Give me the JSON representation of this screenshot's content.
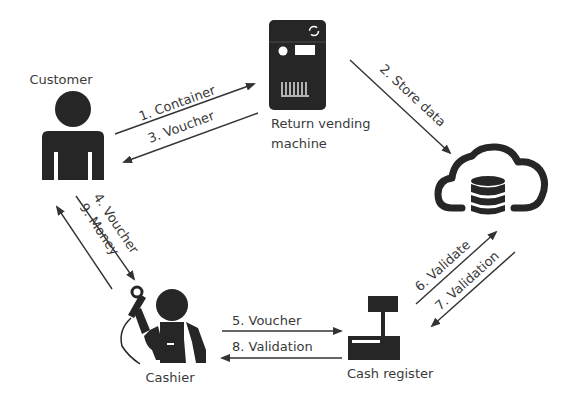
{
  "diagram": {
    "nodes": {
      "customer": {
        "label": "Customer",
        "icon": "person-icon"
      },
      "return_vending_machine": {
        "label_line1": "Return vending",
        "label_line2": "machine",
        "icon": "vending-machine-icon"
      },
      "cloud_database": {
        "label": "",
        "icon": "cloud-database-icon"
      },
      "cash_register": {
        "label": "Cash register",
        "icon": "cash-register-icon"
      },
      "cashier": {
        "label": "Cashier",
        "icon": "cashier-with-scanner-icon"
      }
    },
    "edges": [
      {
        "step": 1,
        "label": "1. Container",
        "from": "Customer",
        "to": "Return vending machine"
      },
      {
        "step": 2,
        "label": "2. Store data",
        "from": "Return vending machine",
        "to": "Cloud database"
      },
      {
        "step": 3,
        "label": "3. Voucher",
        "from": "Return vending machine",
        "to": "Customer"
      },
      {
        "step": 4,
        "label": "4. Voucher",
        "from": "Customer",
        "to": "Cashier"
      },
      {
        "step": 5,
        "label": "5. Voucher",
        "from": "Cashier",
        "to": "Cash register"
      },
      {
        "step": 6,
        "label": "6. Validate",
        "from": "Cash register",
        "to": "Cloud database"
      },
      {
        "step": 7,
        "label": "7. Validation",
        "from": "Cloud database",
        "to": "Cash register"
      },
      {
        "step": 8,
        "label": "8. Validation",
        "from": "Cash register",
        "to": "Cashier"
      },
      {
        "step": 9,
        "label": "9. Money",
        "from": "Cashier",
        "to": "Customer"
      }
    ]
  }
}
